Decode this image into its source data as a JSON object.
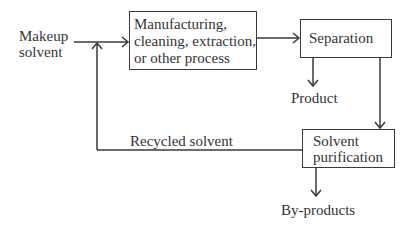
{
  "diagram": {
    "inputs": {
      "makeup_line1": "Makeup",
      "makeup_line2": "solvent"
    },
    "boxes": {
      "process": {
        "line1": "Manufacturing,",
        "line2": "cleaning, extraction,",
        "line3": "or other process"
      },
      "separation": {
        "line1": "Separation"
      },
      "purification": {
        "line1": "Solvent",
        "line2": "purification"
      }
    },
    "outputs": {
      "product": "Product",
      "byproducts": "By-products"
    },
    "labels": {
      "recycled": "Recycled solvent"
    },
    "colors": {
      "line": "#3a3a3a",
      "text": "#333333",
      "background": "#ffffff"
    }
  }
}
